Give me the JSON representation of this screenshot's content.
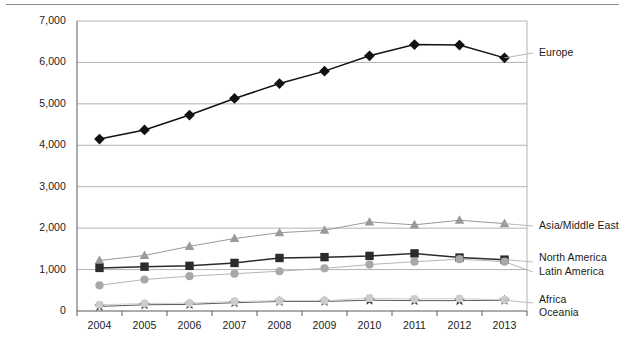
{
  "chart_data": {
    "type": "line",
    "title": "",
    "xlabel": "",
    "ylabel": "",
    "ylim": [
      0,
      7000
    ],
    "xlim_categories": [
      "2004",
      "2005",
      "2006",
      "2007",
      "2008",
      "2009",
      "2010",
      "2011",
      "2012",
      "2013"
    ],
    "grid": "horizontal",
    "legend_position": "right-inline",
    "categories": [
      "2004",
      "2005",
      "2006",
      "2007",
      "2008",
      "2009",
      "2010",
      "2011",
      "2012",
      "2013"
    ],
    "y_ticks": [
      "0",
      "1,000",
      "2,000",
      "3,000",
      "4,000",
      "5,000",
      "6,000",
      "7,000"
    ],
    "y_tick_values": [
      0,
      1000,
      2000,
      3000,
      4000,
      5000,
      6000,
      7000
    ],
    "series": [
      {
        "name": "Europe",
        "marker": "diamond",
        "color": "#121212",
        "line_color": "#121212",
        "values": [
          4150,
          4370,
          4730,
          5130,
          5490,
          5790,
          6160,
          6430,
          6420,
          6110
        ]
      },
      {
        "name": "Asia/Middle East",
        "marker": "triangle",
        "color": "#9a9a9a",
        "line_color": "#9a9a9a",
        "values": [
          1220,
          1340,
          1560,
          1750,
          1890,
          1950,
          2150,
          2080,
          2190,
          2110
        ]
      },
      {
        "name": "North America",
        "marker": "square",
        "color": "#2b2b2b",
        "line_color": "#2b2b2b",
        "values": [
          1040,
          1070,
          1090,
          1160,
          1280,
          1300,
          1330,
          1390,
          1290,
          1240
        ]
      },
      {
        "name": "Latin America",
        "marker": "circle",
        "color": "#a8a8a8",
        "line_color": "#b5b5b5",
        "values": [
          620,
          760,
          840,
          900,
          960,
          1030,
          1120,
          1190,
          1250,
          1190
        ]
      },
      {
        "name": "Africa",
        "marker": "star",
        "color": "#3a3a3a",
        "line_color": "#5a5a5a",
        "values": [
          110,
          150,
          160,
          200,
          230,
          230,
          260,
          250,
          250,
          260
        ]
      },
      {
        "name": "Oceania",
        "marker": "circle",
        "color": "#cccccc",
        "line_color": "#cfcfcf",
        "values": [
          150,
          180,
          190,
          230,
          250,
          250,
          310,
          290,
          300,
          270
        ]
      }
    ],
    "legend_entries": [
      {
        "label": "Europe",
        "series": "Europe"
      },
      {
        "label": "Asia/Middle East",
        "series": "Asia/Middle East"
      },
      {
        "label": "North America",
        "series": "North America"
      },
      {
        "label": "Latin America",
        "series": "Latin America"
      },
      {
        "label": "Africa",
        "series": "Africa"
      },
      {
        "label": "Oceania",
        "series": "Oceania"
      }
    ]
  }
}
